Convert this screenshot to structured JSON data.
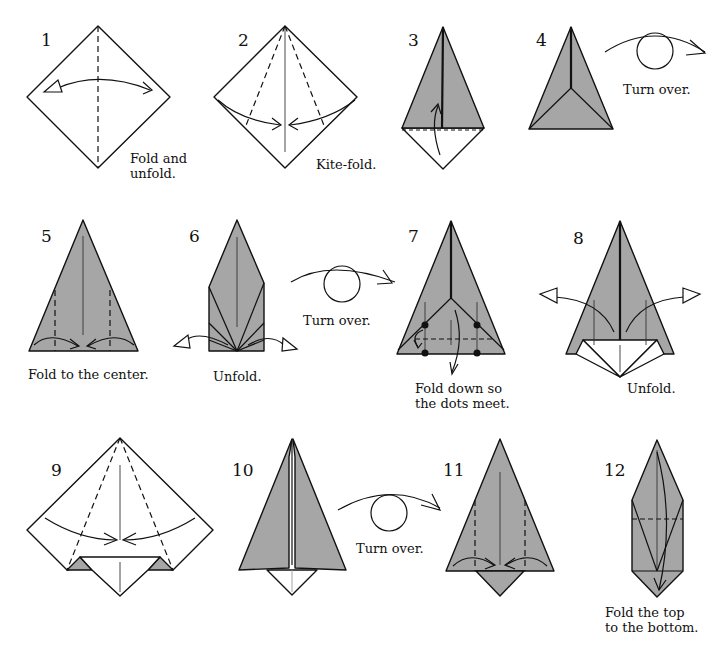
{
  "steps": [
    {
      "number": "1",
      "caption": "Fold and\nunfold.",
      "caption_lines": [
        "Fold and",
        "unfold."
      ]
    },
    {
      "number": "2",
      "caption": "Kite-fold.",
      "caption_lines": [
        "Kite-fold."
      ]
    },
    {
      "number": "3",
      "caption": "",
      "caption_lines": []
    },
    {
      "number": "4",
      "caption": "Turn over.",
      "caption_lines": [
        "Turn over."
      ]
    },
    {
      "number": "5",
      "caption": "Fold to the center.",
      "caption_lines": [
        "Fold to the center."
      ]
    },
    {
      "number": "6",
      "caption": "Unfold.",
      "caption_lines": [
        "Unfold."
      ]
    },
    {
      "number": "7",
      "caption": "Fold down so\nthe dots meet.",
      "caption_lines": [
        "Fold down so",
        "the dots meet."
      ]
    },
    {
      "number": "8",
      "caption": "Unfold.",
      "caption_lines": [
        "Unfold."
      ]
    },
    {
      "number": "9",
      "caption": "",
      "caption_lines": []
    },
    {
      "number": "10",
      "caption": "",
      "caption_lines": []
    },
    {
      "number": "11",
      "caption": "",
      "caption_lines": []
    },
    {
      "number": "12",
      "caption": "Fold the top\nto the bottom.",
      "caption_lines": [
        "Fold the top",
        "to the bottom."
      ]
    }
  ],
  "turn_over_labels": [
    "Turn over.",
    "Turn over.",
    "Turn over."
  ],
  "colors": {
    "paper_gray": "#a6a6a6",
    "line": "#111111",
    "background": "#ffffff"
  }
}
